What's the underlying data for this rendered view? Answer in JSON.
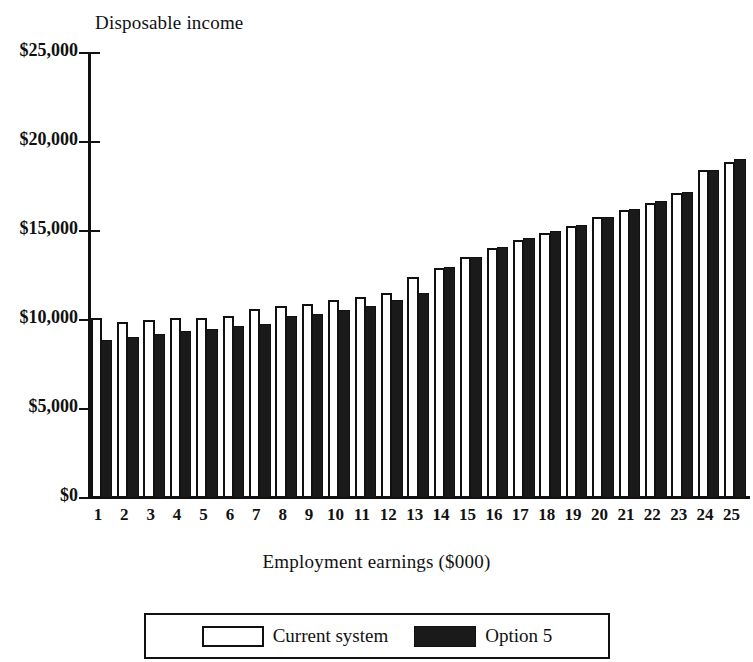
{
  "chart_data": {
    "type": "bar",
    "title": "",
    "ylabel": "Disposable income",
    "xlabel": "Employment earnings ($000)",
    "categories": [
      "1",
      "2",
      "3",
      "4",
      "5",
      "6",
      "7",
      "8",
      "9",
      "10",
      "11",
      "12",
      "13",
      "14",
      "15",
      "16",
      "17",
      "18",
      "19",
      "20",
      "21",
      "22",
      "23",
      "24",
      "25"
    ],
    "ylim": [
      0,
      25000
    ],
    "yticks": [
      0,
      5000,
      10000,
      15000,
      20000,
      25000
    ],
    "ytick_labels": [
      "$0",
      "$5,000",
      "$10,000",
      "$15,000",
      "$20,000",
      "$25,000"
    ],
    "grid": false,
    "legend_position": "bottom",
    "series": [
      {
        "name": "Current system",
        "color": "#ffffff",
        "values": [
          10100,
          9900,
          10000,
          10100,
          10100,
          10200,
          10600,
          10800,
          10900,
          11100,
          11300,
          11500,
          12400,
          12950,
          13550,
          14050,
          14500,
          14900,
          15300,
          15800,
          16200,
          16600,
          17150,
          18400,
          18900
        ]
      },
      {
        "name": "Option 5",
        "color": "#1a1a1a",
        "values": [
          8900,
          9050,
          9200,
          9400,
          9500,
          9650,
          9800,
          10200,
          10350,
          10550,
          10800,
          11150,
          11500,
          13000,
          13550,
          14100,
          14600,
          15000,
          15350,
          15800,
          16250,
          16700,
          17200,
          18400,
          19050
        ]
      }
    ]
  },
  "legend": {
    "items": [
      {
        "label": "Current system",
        "swatch": "outline-white-swatch"
      },
      {
        "label": "Option 5",
        "swatch": "filled-black-swatch"
      }
    ]
  }
}
